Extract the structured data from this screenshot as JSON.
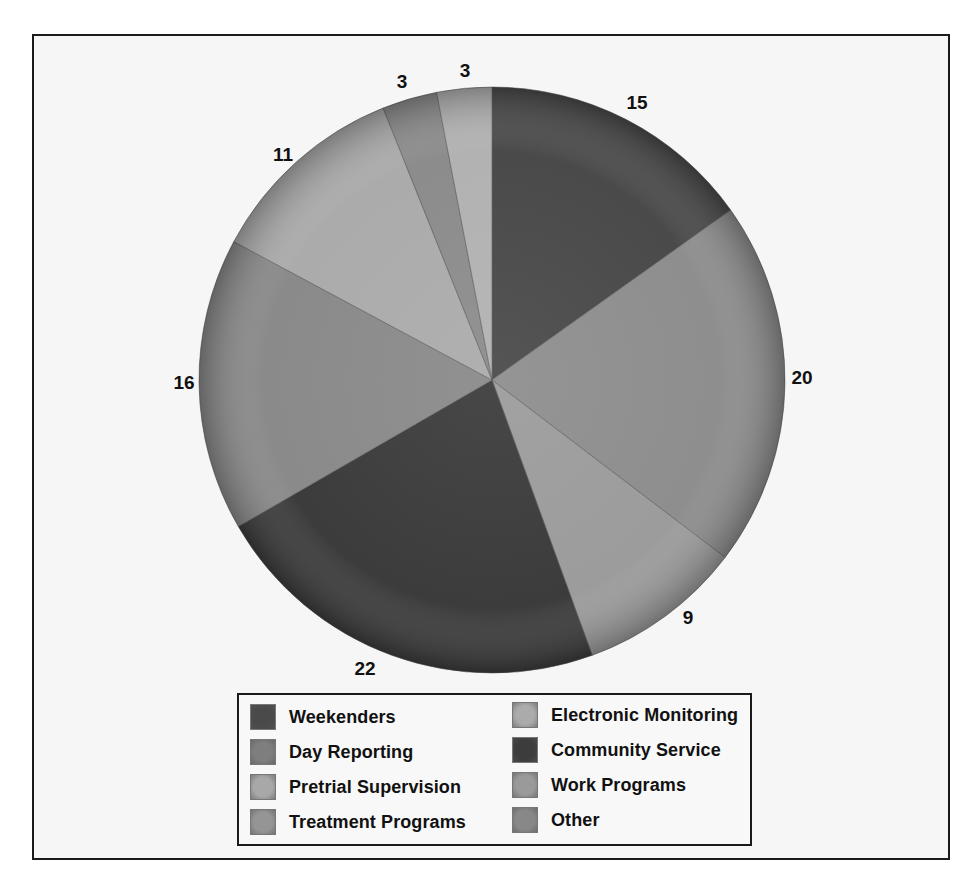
{
  "chart_data": {
    "type": "pie",
    "title": "",
    "start_angle": "12 o'clock",
    "direction": "clockwise",
    "slices": [
      {
        "label": "Weekenders",
        "value": 15,
        "color": "#4a4a4a"
      },
      {
        "label": "Day Reporting",
        "value": 20,
        "color": "#8e8e8e"
      },
      {
        "label": "Pretrial Supervision",
        "value": 9,
        "color": "#9c9c9c"
      },
      {
        "label": "Community Service",
        "value": 22,
        "color": "#3c3c3c"
      },
      {
        "label": "Treatment Programs",
        "value": 16,
        "color": "#8a8a8a"
      },
      {
        "label": "Electronic Monitoring",
        "value": 11,
        "color": "#ababab"
      },
      {
        "label": "Work Programs",
        "value": 3,
        "color": "#8c8c8c"
      },
      {
        "label": "Other",
        "value": 3,
        "color": "#b2b2b2"
      }
    ],
    "data_labels": [
      "15",
      "20",
      "9",
      "22",
      "16",
      "11",
      "3",
      "3"
    ],
    "legend": {
      "position": "bottom",
      "columns": 2,
      "entries": [
        {
          "label": "Weekenders",
          "color": "#4a4a4a"
        },
        {
          "label": "Day Reporting",
          "color": "#7e7e7e"
        },
        {
          "label": "Pretrial Supervision",
          "color": "#a8a8a8"
        },
        {
          "label": "Treatment Programs",
          "color": "#959595"
        },
        {
          "label": "Electronic Monitoring",
          "color": "#ababab"
        },
        {
          "label": "Community Service",
          "color": "#3c3c3c"
        },
        {
          "label": "Work Programs",
          "color": "#9a9a9a"
        },
        {
          "label": "Other",
          "color": "#888888"
        }
      ]
    }
  }
}
